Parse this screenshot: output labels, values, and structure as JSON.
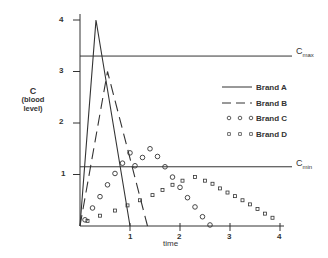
{
  "chart_data": {
    "type": "line",
    "title": "",
    "xlabel": "time",
    "ylabel": "C (blood level)",
    "ylabel_lines": [
      "C",
      "(blood",
      "level)"
    ],
    "xlim": [
      0,
      4.3
    ],
    "ylim": [
      0,
      4.2
    ],
    "x_ticks": [
      "1",
      "2",
      "3",
      "4"
    ],
    "y_ticks": [
      "1",
      "2",
      "3",
      "4"
    ],
    "grid": false,
    "legend_position": "right",
    "reference_lines": [
      {
        "name": "Cmax",
        "label_main": "C",
        "label_sub": "max",
        "y": 3.3
      },
      {
        "name": "Cmin",
        "label_main": "C",
        "label_sub": "min",
        "y": 1.15
      }
    ],
    "series": [
      {
        "name": "Brand A",
        "style": "solid",
        "x": [
          0,
          0.32,
          1.0
        ],
        "y": [
          0,
          4.0,
          0
        ]
      },
      {
        "name": "Brand B",
        "style": "dashed",
        "x": [
          0,
          0.55,
          1.35
        ],
        "y": [
          0,
          3.0,
          0
        ]
      },
      {
        "name": "Brand C",
        "style": "circles",
        "x": [
          0.1,
          0.25,
          0.4,
          0.55,
          0.7,
          0.85,
          1.0,
          1.1,
          1.25,
          1.4,
          1.55,
          1.7,
          1.85,
          2.0,
          2.15,
          2.3,
          2.45,
          2.6
        ],
        "y": [
          0.12,
          0.35,
          0.57,
          0.8,
          1.02,
          1.22,
          1.42,
          1.17,
          1.33,
          1.5,
          1.35,
          1.15,
          0.95,
          0.75,
          0.55,
          0.37,
          0.18,
          0.02
        ]
      },
      {
        "name": "Brand D",
        "style": "squares",
        "x": [
          0.15,
          0.4,
          0.7,
          0.95,
          1.2,
          1.45,
          1.65,
          1.85,
          2.05,
          2.3,
          2.5,
          2.65,
          2.8,
          2.95,
          3.1,
          3.25,
          3.4,
          3.55,
          3.7,
          3.85
        ],
        "y": [
          0.1,
          0.2,
          0.3,
          0.4,
          0.5,
          0.6,
          0.7,
          0.8,
          0.88,
          0.95,
          0.88,
          0.82,
          0.73,
          0.65,
          0.58,
          0.5,
          0.42,
          0.33,
          0.24,
          0.16
        ]
      }
    ]
  },
  "legend": [
    {
      "label": "Brand A",
      "style": "solid"
    },
    {
      "label": "Brand B",
      "style": "dashed"
    },
    {
      "label": "Brand C",
      "style": "circles"
    },
    {
      "label": "Brand D",
      "style": "squares"
    }
  ]
}
